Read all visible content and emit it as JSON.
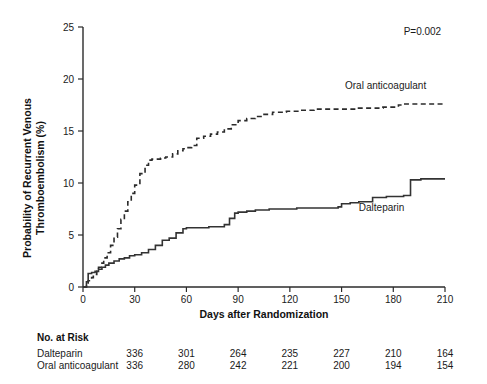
{
  "chart_data": {
    "type": "line",
    "title": "",
    "xlabel": "Days after Randomization",
    "ylabel": "Probability of Recurrent Venous Thromboembolism (%)",
    "ylabel_line1": "Probability of Recurrent Venous",
    "ylabel_line2": "Thromboembolism (%)",
    "xlim": [
      0,
      210
    ],
    "ylim": [
      0,
      25
    ],
    "xticks": [
      0,
      30,
      60,
      90,
      120,
      150,
      180,
      210
    ],
    "yticks": [
      0,
      5,
      10,
      15,
      20,
      25
    ],
    "grid": false,
    "legend_position": "inline-annotation",
    "annotations": [
      {
        "text": "P=0.002",
        "x": 186,
        "y": 24.2
      },
      {
        "text": "Oral anticoagulant",
        "x": 152,
        "y": 19.0
      },
      {
        "text": "Dalteparin",
        "x": 160,
        "y": 7.3
      }
    ],
    "series": [
      {
        "name": "Oral anticoagulant",
        "style": "dashed",
        "x": [
          0,
          2,
          3,
          5,
          6,
          8,
          9,
          11,
          12,
          14,
          16,
          18,
          20,
          22,
          24,
          26,
          28,
          30,
          33,
          36,
          38,
          40,
          42,
          45,
          48,
          52,
          55,
          58,
          60,
          63,
          66,
          70,
          74,
          78,
          82,
          86,
          90,
          95,
          100,
          105,
          110,
          118,
          126,
          134,
          142,
          150,
          158,
          166,
          174,
          180,
          183,
          186,
          195,
          205,
          210
        ],
        "y": [
          0,
          0.3,
          0.6,
          0.9,
          1.2,
          1.5,
          1.9,
          2.3,
          2.8,
          3.3,
          4.0,
          4.8,
          5.6,
          6.5,
          7.3,
          8.2,
          9.0,
          9.8,
          10.9,
          11.7,
          12.2,
          12.3,
          12.3,
          12.4,
          12.5,
          12.8,
          13.1,
          13.3,
          13.4,
          13.6,
          14.3,
          14.5,
          14.7,
          14.9,
          15.2,
          15.6,
          16.0,
          16.2,
          16.4,
          16.6,
          16.8,
          16.9,
          17.0,
          17.1,
          17.1,
          17.1,
          17.2,
          17.2,
          17.3,
          17.3,
          17.5,
          17.6,
          17.6,
          17.6,
          17.6
        ]
      },
      {
        "name": "Dalteparin",
        "style": "solid",
        "x": [
          0,
          2,
          3,
          5,
          7,
          9,
          11,
          13,
          15,
          18,
          21,
          24,
          27,
          30,
          34,
          38,
          42,
          46,
          50,
          54,
          58,
          60,
          63,
          66,
          68,
          70,
          73,
          76,
          79,
          82,
          85,
          88,
          90,
          95,
          100,
          108,
          116,
          124,
          130,
          136,
          142,
          148,
          150,
          155,
          160,
          168,
          176,
          182,
          186,
          190,
          196,
          204,
          210
        ],
        "y": [
          0,
          0.5,
          1.3,
          1.4,
          1.5,
          1.7,
          1.9,
          2.1,
          2.3,
          2.5,
          2.7,
          2.8,
          3.0,
          3.1,
          3.3,
          3.6,
          4.0,
          4.5,
          4.7,
          5.2,
          5.6,
          5.7,
          5.7,
          5.7,
          5.7,
          5.7,
          5.8,
          5.8,
          5.8,
          6.0,
          6.6,
          7.1,
          7.2,
          7.3,
          7.4,
          7.5,
          7.5,
          7.6,
          7.6,
          7.6,
          7.6,
          7.7,
          8.0,
          8.1,
          8.2,
          8.6,
          8.7,
          8.7,
          8.8,
          10.3,
          10.4,
          10.4,
          10.4
        ]
      }
    ]
  },
  "risk_table": {
    "heading": "No. at Risk",
    "timepoints": [
      0,
      30,
      60,
      90,
      120,
      150,
      180,
      210
    ],
    "rows": [
      {
        "label": "Dalteparin",
        "values": [
          "336",
          "301",
          "264",
          "235",
          "227",
          "210",
          "164"
        ]
      },
      {
        "label": "Oral anticoagulant",
        "values": [
          "336",
          "280",
          "242",
          "221",
          "200",
          "194",
          "154"
        ]
      }
    ]
  },
  "style": {
    "axis_color": "#2b2b2b",
    "solid_curve_color": "#333333",
    "dashed_curve_color": "#2b2b2b",
    "text_color": "#1a1a1a",
    "background": "#ffffff"
  }
}
